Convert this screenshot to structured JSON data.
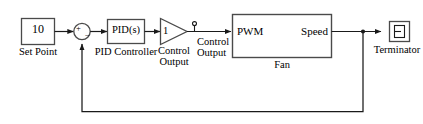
{
  "diagram": {
    "type": "simulink-block-diagram",
    "colors": {
      "line": "#1a1a1a",
      "block_border": "#4a4a4a",
      "background": "#ffffff",
      "text": "#000000"
    }
  },
  "blocks": {
    "set_point": {
      "value": "10",
      "name": "Set Point",
      "kind": "constant-block"
    },
    "sum": {
      "plus_sign": "+",
      "minus_sign": "−",
      "kind": "sum-junction"
    },
    "pid": {
      "value": "PID(s)",
      "name": "PID Controller",
      "kind": "pid-controller-block"
    },
    "gain": {
      "value": "1",
      "name_line1": "Control",
      "name_line2": "Output",
      "kind": "gain-block"
    },
    "fan": {
      "input_port": "PWM",
      "output_port": "Speed",
      "name": "Fan",
      "kind": "subsystem-block"
    },
    "terminator": {
      "glyph": "⊐",
      "name": "Terminator",
      "kind": "terminator-block"
    }
  },
  "signals": {
    "control_output": {
      "line1": "Control",
      "line2": "Output"
    }
  }
}
